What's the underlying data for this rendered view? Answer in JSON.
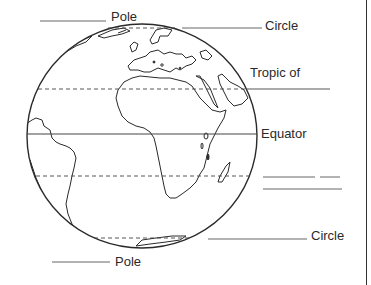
{
  "worksheet": {
    "title": "Globe latitude lines worksheet",
    "labels": {
      "north_pole": "Pole",
      "arctic_circle": "Circle",
      "tropic_of_cancer": "Tropic of",
      "equator": "Equator",
      "tropic_of_capricorn_blank": "",
      "antarctic_circle": "Circle",
      "south_pole": "Pole"
    },
    "blanks": [
      {
        "id": "north-pole-blank",
        "for": "Pole"
      },
      {
        "id": "arctic-circle-blank",
        "for": "Circle"
      },
      {
        "id": "tropic-of-cancer-blank",
        "for": "Tropic of"
      },
      {
        "id": "tropic-of-capricorn-blank-1",
        "for": ""
      },
      {
        "id": "tropic-of-capricorn-blank-2",
        "for": ""
      },
      {
        "id": "antarctic-circle-blank",
        "for": "Circle"
      },
      {
        "id": "south-pole-blank",
        "for": "Pole"
      }
    ],
    "latitude_lines": [
      {
        "name": "arctic-circle",
        "style": "dashed"
      },
      {
        "name": "tropic-of-cancer",
        "style": "dashed"
      },
      {
        "name": "equator",
        "style": "solid"
      },
      {
        "name": "tropic-of-capricorn",
        "style": "dashed"
      },
      {
        "name": "antarctic-circle",
        "style": "dashed"
      }
    ],
    "colors": {
      "ink": "#2a2a2a",
      "background": "#ffffff"
    }
  }
}
